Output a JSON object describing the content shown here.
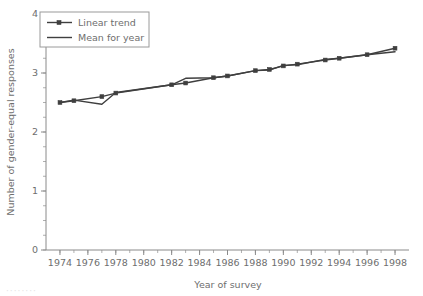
{
  "chart_data": {
    "type": "line",
    "title": "",
    "xlabel": "Year of survey",
    "ylabel": "Number of gender-equal responses",
    "xlim": [
      1973,
      1999
    ],
    "ylim": [
      0,
      4
    ],
    "yticks": [
      0,
      1,
      2,
      3,
      4
    ],
    "ytick_labels": [
      "0",
      "1",
      "2",
      "3",
      "4"
    ],
    "xticks": [
      1974,
      1976,
      1978,
      1980,
      1982,
      1984,
      1986,
      1988,
      1990,
      1992,
      1994,
      1996,
      1998
    ],
    "xtick_labels": [
      "1974",
      "1976",
      "1978",
      "1980",
      "1982",
      "1984",
      "1986",
      "1988",
      "1990",
      "1992",
      "1994",
      "1996",
      "1998"
    ],
    "y_minor_step": 0.25,
    "x_minor_step": 1,
    "grid": false,
    "legend_position": "upper-left",
    "series": [
      {
        "name": "Linear trend",
        "markers": true,
        "color": "#3f3f3f",
        "x": [
          1974,
          1975,
          1977,
          1978,
          1982,
          1983,
          1985,
          1986,
          1988,
          1989,
          1990,
          1991,
          1993,
          1994,
          1996,
          1998
        ],
        "values": [
          2.5,
          2.53,
          2.6,
          2.66,
          2.8,
          2.83,
          2.92,
          2.95,
          3.04,
          3.06,
          3.12,
          3.15,
          3.22,
          3.25,
          3.31,
          3.42
        ]
      },
      {
        "name": "Mean for year",
        "markers": false,
        "color": "#3f3f3f",
        "x": [
          1974,
          1975,
          1977,
          1978,
          1982,
          1983,
          1985,
          1986,
          1988,
          1989,
          1990,
          1991,
          1993,
          1994,
          1996,
          1998
        ],
        "values": [
          2.5,
          2.54,
          2.47,
          2.67,
          2.8,
          2.91,
          2.92,
          2.95,
          3.04,
          3.05,
          3.13,
          3.14,
          3.23,
          3.25,
          3.31,
          3.36
        ]
      }
    ]
  },
  "legend": {
    "entries": [
      {
        "label": "Linear trend"
      },
      {
        "label": "Mean for year"
      }
    ]
  },
  "caption": {
    "partial_text": "········"
  }
}
